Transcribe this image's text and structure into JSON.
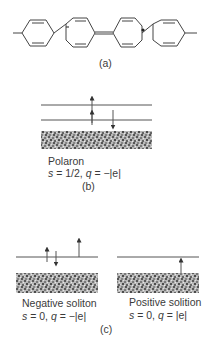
{
  "figure": {
    "panel_a": {
      "caption": "(a)",
      "description": "Chain of four para-phenylene rings; second ring has negative charge mark, third ring has radical dot; quinoid double bond between rings 2 and 3"
    },
    "panel_b": {
      "caption": "(b)",
      "title": "Polaron",
      "formula_s": "s",
      "formula_rest_1": " = 1/2, ",
      "formula_q": "q",
      "formula_rest_2": " = −|e|",
      "levels": 2,
      "spins": [
        "up-long",
        "up",
        "down"
      ]
    },
    "panel_c": {
      "caption": "(c)",
      "left": {
        "title": "Negative soliton",
        "formula_s": "s",
        "formula_rest_1": " = 0, ",
        "formula_q": "q",
        "formula_rest_2": " = −|e|",
        "spins": [
          "up",
          "down"
        ]
      },
      "right": {
        "title": "Positive solition",
        "formula_s": "s",
        "formula_rest_1": " = 0, ",
        "formula_q": "q",
        "formula_rest_2": " = |e|",
        "spins": [
          "up-from-band"
        ]
      }
    },
    "colors": {
      "line": "#555555",
      "band_dark": "#6a6a6a",
      "band_light": "#c8c8c8",
      "text": "#3a3a3a"
    }
  }
}
